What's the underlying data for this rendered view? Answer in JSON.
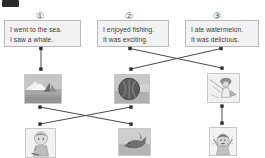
{
  "page": {
    "corner_mark": "black-corner-mark",
    "background_color": "#ffffff",
    "line_color": "#4a4a4a",
    "box_fill_color": "#f2f2f2",
    "box_border_color": "#b9b9b9"
  },
  "numbers": [
    {
      "id": "number-1",
      "label": "①"
    },
    {
      "id": "number-2",
      "label": "②"
    },
    {
      "id": "number-3",
      "label": "③"
    }
  ],
  "sentence_boxes": [
    {
      "id": "sentence-box-1",
      "number": "①",
      "line1": "I went to the sea.",
      "line2": "I saw a whale."
    },
    {
      "id": "sentence-box-2",
      "number": "②",
      "line1": "I enjoyed fishing.",
      "line2": "It was exciting."
    },
    {
      "id": "sentence-box-3",
      "number": "③",
      "line1": "I ate watermelon.",
      "line2": "It was delicious."
    }
  ],
  "middle_row_images": [
    {
      "id": "image-sea",
      "alt": "sea-with-sailboat-photo"
    },
    {
      "id": "image-watermelon",
      "alt": "watermelon-photo"
    },
    {
      "id": "image-fishing",
      "alt": "person-fishing-photo"
    }
  ],
  "bottom_row_images": [
    {
      "id": "image-boy",
      "alt": "boy-photo"
    },
    {
      "id": "image-whale",
      "alt": "whale-photo"
    },
    {
      "id": "image-happy-child",
      "alt": "happy-child-photo"
    }
  ],
  "connections": [
    {
      "id": "link-box1-to-sea",
      "from": "sentence-box-1",
      "to": "image-sea"
    },
    {
      "id": "link-box2-to-fishing",
      "from": "sentence-box-2",
      "to": "image-fishing"
    },
    {
      "id": "link-box3-to-watermelon",
      "from": "sentence-box-3",
      "to": "image-watermelon"
    },
    {
      "id": "link-sea-to-whale",
      "from": "image-sea",
      "to": "image-whale"
    },
    {
      "id": "link-watermelon-to-boy",
      "from": "image-watermelon",
      "to": "image-boy"
    },
    {
      "id": "link-fishing-to-happy-child",
      "from": "image-fishing",
      "to": "image-happy-child"
    }
  ]
}
